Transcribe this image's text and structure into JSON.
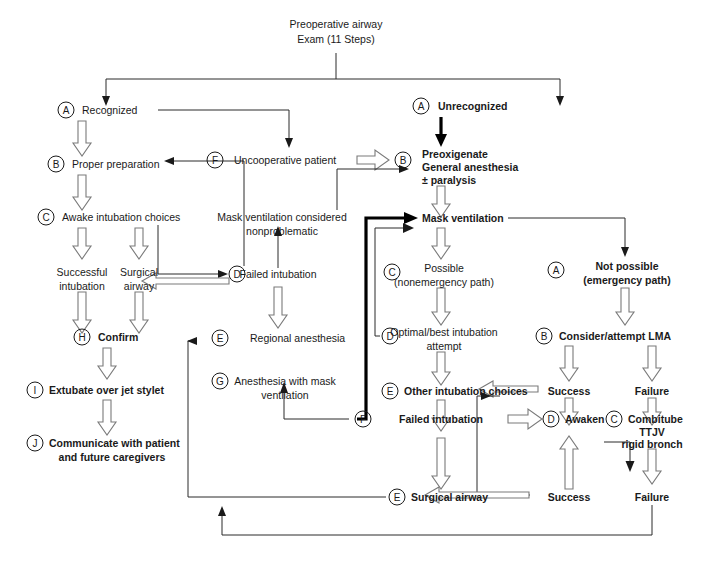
{
  "diagram": {
    "root": {
      "line1": "Preoperative airway",
      "line2": "Exam (11 Steps)"
    },
    "nodes": {
      "recognized": {
        "badge": "A",
        "text": "Recognized",
        "bold": false
      },
      "unrecognized": {
        "badge": "A",
        "text": "Unrecognized",
        "bold": true
      },
      "proper_preparation": {
        "badge": "B",
        "text": "Proper preparation",
        "bold": false
      },
      "uncooperative_patient": {
        "badge": "F",
        "text": "Uncooperative patient",
        "bold": false
      },
      "preoxigenate": {
        "badge": "B",
        "line1": "Preoxigenate",
        "line2": "General anesthesia",
        "line3": "± paralysis",
        "bold": true
      },
      "awake_intubation_choices": {
        "badge": "C",
        "text": "Awake intubation choices",
        "bold": false
      },
      "mask_vent_nonproblematic": {
        "line1": "Mask ventilation considered",
        "line2": "nonproblematic",
        "bold": false
      },
      "mask_ventilation": {
        "text": "Mask ventilation",
        "bold": true
      },
      "successful_intubation": {
        "line1": "Successful",
        "line2": "intubation",
        "bold": false
      },
      "surgical_airway_left": {
        "line1": "Surgical",
        "line2": "airway",
        "bold": false
      },
      "d_failed_intubation": {
        "badge": "D",
        "text": "Failed intubation",
        "bold": false
      },
      "possible": {
        "badge": "C",
        "line1": "Possible",
        "line2": "(nonemergency path)",
        "bold": false
      },
      "not_possible": {
        "badge": "A",
        "line1": "Not possible",
        "line2": "(emergency path)",
        "bold": true
      },
      "confirm": {
        "badge": "H",
        "text": "Confirm",
        "bold": true
      },
      "regional_anesthesia": {
        "badge": "E",
        "text": "Regional anesthesia",
        "bold": false
      },
      "optimal_attempt": {
        "badge": "D",
        "line1": "Optimal/best intubation",
        "line2": "attempt",
        "bold": false
      },
      "consider_lma": {
        "badge": "B",
        "text": "Consider/attempt LMA",
        "bold": true
      },
      "extubate": {
        "badge": "I",
        "text": "Extubate over jet stylet",
        "bold": true
      },
      "anesthesia_mask_vent": {
        "badge": "G",
        "line1": "Anesthesia with mask",
        "line2": "ventilation",
        "bold": false
      },
      "other_intubation_choices": {
        "badge": "E",
        "text": "Other intubation choices",
        "bold": true
      },
      "lma_success": {
        "text": "Success",
        "bold": true
      },
      "lma_failure": {
        "text": "Failure",
        "bold": true
      },
      "communicate": {
        "badge": "J",
        "line1": "Communicate with patient",
        "line2": "and future caregivers",
        "bold": true
      },
      "f_failed_intubation": {
        "badge": "F",
        "text": "Failed intubation",
        "bold": true
      },
      "awaken": {
        "badge": "D",
        "text": "Awaken",
        "bold": true
      },
      "combitube": {
        "badge": "C",
        "line1": "Combitube",
        "line2": "TTJV",
        "line3": "rigid bronch",
        "bold": true
      },
      "surgical_airway_right": {
        "badge": "E",
        "text": "Surgical airway",
        "bold": true
      },
      "combitube_success": {
        "text": "Success",
        "bold": true
      },
      "combitube_failure": {
        "text": "Failure",
        "bold": true
      }
    },
    "colors": {
      "ink": "#1a1a1a",
      "thin_line": "#2a2a2a",
      "thick_line": "#000000",
      "open_arrow_stroke": "#7a7a7a",
      "background": "#ffffff"
    }
  }
}
